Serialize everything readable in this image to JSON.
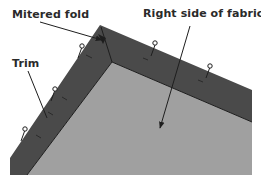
{
  "diagram": {
    "labels": {
      "mitered_fold": "Mitered fold",
      "right_side": "Right side of fabric",
      "trim": "Trim"
    },
    "colors": {
      "trim": "#4a4a4a",
      "fabric": "#a0a0a0",
      "line": "#1e1e1e",
      "background": "#ffffff"
    },
    "parts": [
      "trim",
      "fabric",
      "mitered-fold",
      "pins"
    ]
  }
}
